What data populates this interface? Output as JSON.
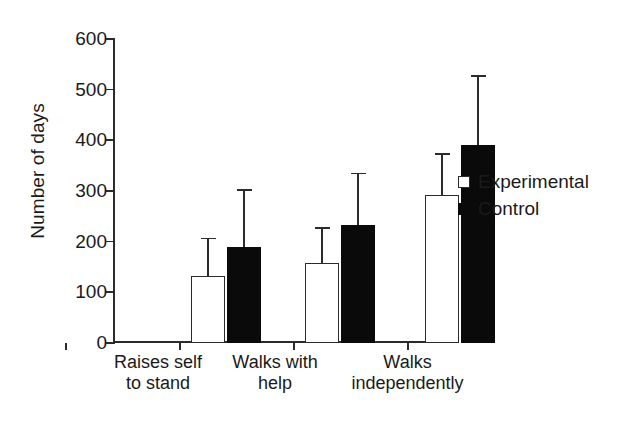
{
  "chart_data": {
    "type": "bar",
    "title": "",
    "xlabel": "",
    "ylabel": "Number of days",
    "ylim": [
      0,
      600
    ],
    "yticks": [
      0,
      100,
      200,
      300,
      400,
      500,
      600
    ],
    "grid": false,
    "legend_position": "right",
    "categories": [
      "Raises self to stand",
      "Walks with help",
      "Walks independently"
    ],
    "category_lines": [
      [
        "Raises self",
        "to stand"
      ],
      [
        "Walks with",
        "help"
      ],
      [
        "Walks",
        "independently"
      ]
    ],
    "series": [
      {
        "name": "Experimental",
        "style": "open",
        "color": "#ffffff",
        "edge_color": "#2b2b2b",
        "values": [
          133,
          158,
          293
        ],
        "error_upper": [
          205,
          225,
          372
        ],
        "errors": [
          72,
          67,
          79
        ]
      },
      {
        "name": "Control",
        "style": "filled",
        "color": "#0a0a0a",
        "edge_color": "#0a0a0a",
        "values": [
          190,
          233,
          390
        ],
        "error_upper": [
          300,
          333,
          525
        ],
        "errors": [
          110,
          100,
          135
        ]
      }
    ]
  },
  "axis": {
    "y_label": "Number of days",
    "y_tick_labels": [
      "0",
      "100",
      "200",
      "300",
      "400",
      "500",
      "600"
    ]
  },
  "legend": {
    "entries": [
      {
        "label": "Experimental",
        "swatch": "open-square-icon"
      },
      {
        "label": "Control",
        "swatch": "filled-square-icon"
      }
    ]
  },
  "categories": [
    {
      "line1": "Raises self",
      "line2": "to stand"
    },
    {
      "line1": "Walks with",
      "line2": "help"
    },
    {
      "line1": "Walks",
      "line2": "independently"
    }
  ]
}
